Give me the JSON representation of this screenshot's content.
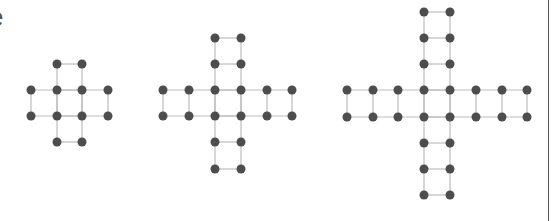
{
  "header": {
    "clipped_text": "e"
  },
  "style": {
    "dot_color": "#4d4d4d",
    "edge_color": "#bdbdbd",
    "border_color": "#555555",
    "dot_radius": 4.5,
    "spacing": 26
  },
  "figures": [
    {
      "name": "cross-figure-1",
      "arm_length": 1,
      "origin": [
        31,
        64
      ],
      "columns_x": [
        31,
        57,
        82,
        108
      ],
      "rows_y": [
        64,
        90,
        116,
        142
      ],
      "center_cols": [
        57,
        82
      ],
      "center_rows": [
        90,
        116
      ]
    },
    {
      "name": "cross-figure-2",
      "arm_length": 2,
      "columns_x": [
        163,
        189,
        215,
        241,
        267,
        292
      ],
      "rows_y": [
        38,
        64,
        90,
        116,
        142,
        169
      ],
      "center_cols": [
        215,
        241
      ],
      "center_rows": [
        90,
        116
      ]
    },
    {
      "name": "cross-figure-3",
      "arm_length": 3,
      "columns_x": [
        347,
        373,
        398,
        424,
        450,
        476,
        502,
        527
      ],
      "rows_y": [
        12,
        38,
        64,
        90,
        117,
        143,
        169,
        195
      ],
      "center_cols": [
        424,
        450
      ],
      "center_rows": [
        90,
        117
      ]
    }
  ]
}
